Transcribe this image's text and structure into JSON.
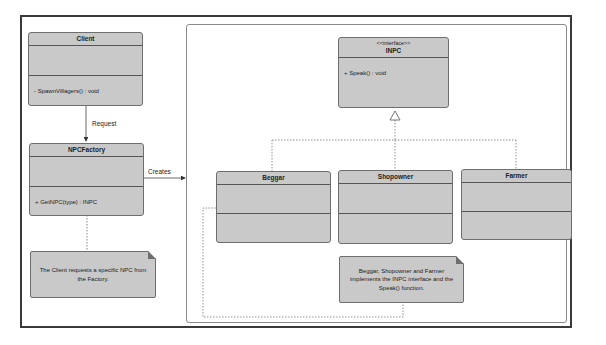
{
  "diagram": {
    "type": "UML class diagram - Factory pattern",
    "classes": {
      "client": {
        "name": "Client",
        "attributes": [],
        "methods": [
          "- SpawnVillagers() : void"
        ]
      },
      "factory": {
        "name": "NPCFactory",
        "attributes": [],
        "methods": [
          "+ GetNPC(type) : INPC"
        ]
      },
      "inpc": {
        "stereotype": "<<interface>>",
        "name": "INPC",
        "methods": [
          "+ Speak() : void"
        ]
      },
      "beggar": {
        "name": "Beggar"
      },
      "shopowner": {
        "name": "Shopowner"
      },
      "farmer": {
        "name": "Farmer"
      }
    },
    "relations": {
      "request": "Request",
      "creates": "Creates"
    },
    "notes": {
      "client_note": "The Client requests a specific NPC from the Factory.",
      "implements_note": "Beggar, Shopowner and Farmer implements the INPC interface and the Speak() function."
    },
    "colors": {
      "class_fill": "#c9c9c9",
      "border": "#6e6e6e",
      "frame": "#3a3a3a"
    }
  }
}
